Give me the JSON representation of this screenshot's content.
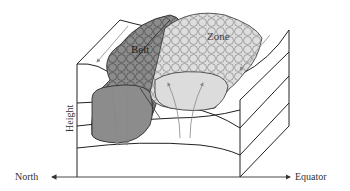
{
  "diagram": {
    "labels": {
      "belt": "Belt",
      "zone": "Zone",
      "height_axis": "Height",
      "left_direction": "North",
      "right_direction": "Equator"
    },
    "colors": {
      "belt_fill": "#8c8c8c",
      "zone_fill": "#dcdcdc",
      "outline": "#222222",
      "arrow": "#888888",
      "background": "#ffffff"
    },
    "flows": {
      "belt": "downward (descending)",
      "zone": "upward (rising)"
    }
  }
}
